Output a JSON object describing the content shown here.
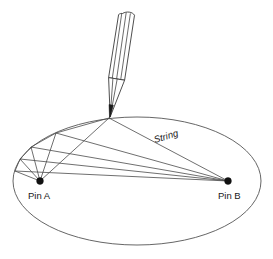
{
  "diagram": {
    "background_color": "#ffffff",
    "line_color": "#4a4a4a",
    "ellipse_color": "#555555",
    "pin_color": "#111111",
    "text_color": "#1a1a1a",
    "labels": {
      "pin_a": "Pin A",
      "pin_b": "Pin B",
      "string": "String"
    },
    "geometry": {
      "ellipse": {
        "cx": 137,
        "cy": 181,
        "rx": 124,
        "ry": 64
      },
      "pin_a": {
        "x": 40,
        "y": 181
      },
      "pin_b": {
        "x": 228,
        "y": 181
      },
      "pencil_tip": {
        "x": 109,
        "y": 118
      },
      "trace_points": [
        {
          "x": 109,
          "y": 118
        },
        {
          "x": 56,
          "y": 133
        },
        {
          "x": 31,
          "y": 147
        },
        {
          "x": 20,
          "y": 159
        },
        {
          "x": 15,
          "y": 171
        }
      ]
    },
    "pencil": {
      "tip_label": "pencil-tip",
      "body_label": "pencil-body"
    }
  }
}
